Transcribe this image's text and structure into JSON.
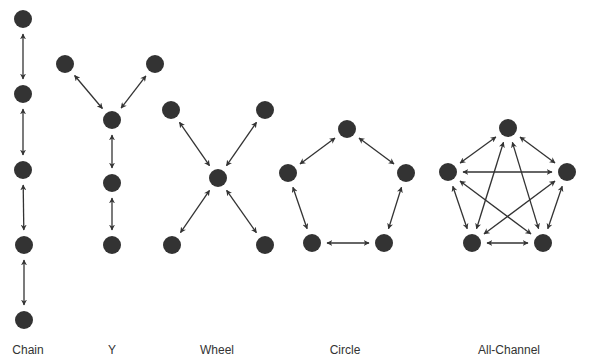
{
  "colors": {
    "node": "#333333",
    "arrow": "#333333",
    "label": "#333333",
    "background": "#ffffff"
  },
  "node_radius": 9,
  "networks": [
    {
      "id": "chain",
      "label": "Chain",
      "label_x": 28,
      "nodes": [
        [
          23,
          19
        ],
        [
          23,
          94
        ],
        [
          23,
          170
        ],
        [
          24,
          245
        ],
        [
          24,
          320
        ]
      ],
      "edges": [
        [
          0,
          1
        ],
        [
          1,
          2
        ],
        [
          2,
          3
        ],
        [
          3,
          4
        ]
      ]
    },
    {
      "id": "y",
      "label": "Y",
      "label_x": 112,
      "nodes": [
        [
          65,
          64
        ],
        [
          155,
          64
        ],
        [
          112,
          120
        ],
        [
          112,
          183
        ],
        [
          112,
          245
        ]
      ],
      "edges": [
        [
          0,
          2
        ],
        [
          1,
          2
        ],
        [
          2,
          3
        ],
        [
          3,
          4
        ]
      ]
    },
    {
      "id": "wheel",
      "label": "Wheel",
      "label_x": 217,
      "nodes": [
        [
          171,
          110
        ],
        [
          265,
          110
        ],
        [
          218,
          178
        ],
        [
          172,
          245
        ],
        [
          265,
          245
        ]
      ],
      "edges": [
        [
          0,
          2
        ],
        [
          1,
          2
        ],
        [
          3,
          2
        ],
        [
          4,
          2
        ]
      ]
    },
    {
      "id": "circle",
      "label": "Circle",
      "label_x": 345,
      "nodes": [
        [
          347,
          129
        ],
        [
          288,
          173
        ],
        [
          406,
          173
        ],
        [
          312,
          243
        ],
        [
          384,
          243
        ]
      ],
      "edges": [
        [
          0,
          1
        ],
        [
          0,
          2
        ],
        [
          1,
          3
        ],
        [
          2,
          4
        ],
        [
          3,
          4
        ]
      ]
    },
    {
      "id": "all-channel",
      "label": "All-Channel",
      "label_x": 509,
      "nodes": [
        [
          508,
          128
        ],
        [
          448,
          172
        ],
        [
          567,
          172
        ],
        [
          472,
          243
        ],
        [
          543,
          243
        ]
      ],
      "edges": [
        [
          0,
          1
        ],
        [
          0,
          2
        ],
        [
          1,
          3
        ],
        [
          2,
          4
        ],
        [
          3,
          4
        ],
        [
          1,
          2
        ],
        [
          0,
          3
        ],
        [
          0,
          4
        ],
        [
          1,
          4
        ],
        [
          2,
          3
        ]
      ]
    }
  ]
}
